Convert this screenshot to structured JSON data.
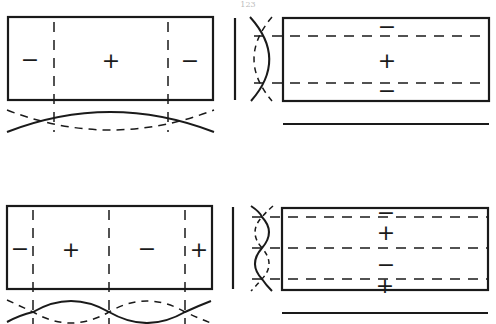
{
  "page_number": "123",
  "colors": {
    "ink": "#1a1a1a",
    "background": "#ffffff"
  },
  "panels": [
    {
      "id": "top-left",
      "description": "Plate with two vertical nodal lines; mode shape along length (first symmetric mode)",
      "signs": [
        "−",
        "+",
        "−"
      ]
    },
    {
      "id": "top-right",
      "description": "Plate with two horizontal nodal lines; mode shape across width",
      "signs": [
        "−",
        "+",
        "−"
      ]
    },
    {
      "id": "bottom-left",
      "description": "Plate with three vertical nodal lines; antisymmetric mode shape along length",
      "signs": [
        "−",
        "+",
        "−",
        "+"
      ]
    },
    {
      "id": "bottom-right",
      "description": "Plate with three horizontal nodal lines; antisymmetric mode shape across width",
      "signs": [
        "−",
        "+",
        "−",
        "+"
      ]
    }
  ]
}
